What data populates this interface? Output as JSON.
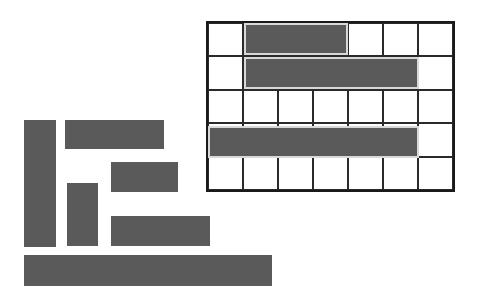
{
  "board": {
    "x": 206,
    "y": 21,
    "width": 249,
    "height": 171,
    "cols": 7,
    "rows": 5,
    "line_color": "#1a1a1a",
    "placed_pieces": [
      {
        "id": "placed-1",
        "row": 0,
        "col": 1,
        "length": 3,
        "orientation": "horizontal"
      },
      {
        "id": "placed-2",
        "row": 1,
        "col": 1,
        "length": 5,
        "orientation": "horizontal"
      },
      {
        "id": "placed-3",
        "row": 3,
        "col": 0,
        "length": 6,
        "orientation": "horizontal"
      }
    ]
  },
  "tray": {
    "pieces": [
      {
        "id": "tall-vertical",
        "x": 24,
        "y": 120,
        "w": 32,
        "h": 127
      },
      {
        "id": "top-horizontal",
        "x": 65,
        "y": 120,
        "w": 99,
        "h": 29
      },
      {
        "id": "short-block",
        "x": 111,
        "y": 162,
        "w": 67,
        "h": 30
      },
      {
        "id": "small-vertical",
        "x": 67,
        "y": 183,
        "w": 31,
        "h": 63
      },
      {
        "id": "mid-horizontal",
        "x": 111,
        "y": 216,
        "w": 99,
        "h": 30
      },
      {
        "id": "long-bottom",
        "x": 24,
        "y": 255,
        "w": 248,
        "h": 31
      }
    ]
  },
  "colors": {
    "piece": "#5a5a5a",
    "background": "#ffffff",
    "placed_outline": "#d8d8d8"
  }
}
